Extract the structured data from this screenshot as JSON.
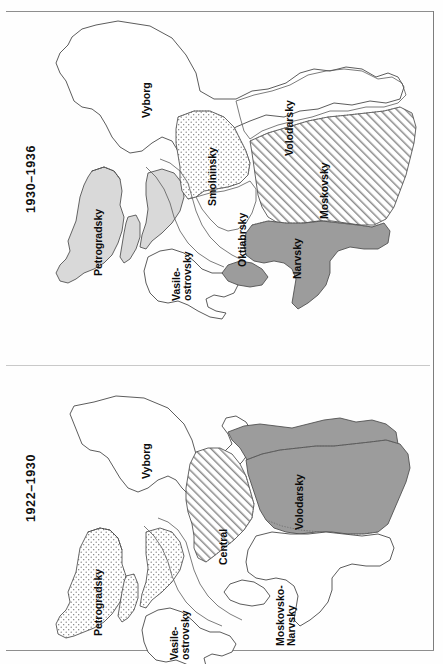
{
  "page": {
    "kind": "scanned-book-page",
    "orientation": "text-rotated-90-ccw",
    "background_color": "#fefefe",
    "border_color": "#8e8e8e"
  },
  "palette": {
    "ink": "#4a4a4a",
    "light_gray_fill": "#d9d9d9",
    "dark_gray_fill": "#9c9c9c",
    "stipple_fill": "#ffffff",
    "hatch_fill": "#ffffff",
    "white_fill": "#ffffff",
    "text": "#0c0c0c"
  },
  "panels": [
    {
      "id": "map-1930-1936",
      "title": "1930–1936",
      "position": "top",
      "districts": [
        {
          "name": "Vyborg",
          "fill": "white",
          "label_lines": [
            "Vyborg"
          ]
        },
        {
          "name": "Petrogradsky",
          "fill": "light-gray",
          "label_lines": [
            "Petrogradsky"
          ]
        },
        {
          "name": "Vasile-ostrovsky",
          "fill": "white",
          "label_lines": [
            "Vasile-",
            "ostrovsky"
          ]
        },
        {
          "name": "Smolninsky",
          "fill": "stipple",
          "label_lines": [
            "Smolninsky"
          ]
        },
        {
          "name": "Oktiabrsky",
          "fill": "white",
          "label_lines": [
            "Oktiabrsky"
          ]
        },
        {
          "name": "Volodarsky",
          "fill": "white",
          "label_lines": [
            "Volodarsky"
          ]
        },
        {
          "name": "Moskovsky",
          "fill": "hatch",
          "label_lines": [
            "Moskovsky"
          ]
        },
        {
          "name": "Narvsky",
          "fill": "dark-gray",
          "label_lines": [
            "Narvsky"
          ]
        }
      ]
    },
    {
      "id": "map-1922-1930",
      "title": "1922–1930",
      "position": "bottom",
      "districts": [
        {
          "name": "Vyborg",
          "fill": "white",
          "label_lines": [
            "Vyborg"
          ]
        },
        {
          "name": "Petrogradsky",
          "fill": "stipple",
          "label_lines": [
            "Petrogradsky"
          ]
        },
        {
          "name": "Vasile-ostrovsky",
          "fill": "stipple",
          "label_lines": [
            "Vasile-",
            "ostrovsky"
          ]
        },
        {
          "name": "Central",
          "fill": "hatch",
          "label_lines": [
            "Central"
          ]
        },
        {
          "name": "Volodarsky",
          "fill": "dark-gray",
          "label_lines": [
            "Volodarsky"
          ]
        },
        {
          "name": "Moskovsko-Narvsky",
          "fill": "white",
          "label_lines": [
            "Moskovsko-",
            "Narvsky"
          ]
        }
      ]
    }
  ]
}
